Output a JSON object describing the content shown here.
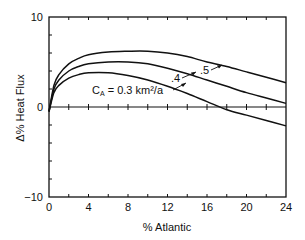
{
  "chart_data": {
    "type": "line",
    "title": "",
    "xlabel": "% Atlantic",
    "ylabel": "Δ% Heat Flux",
    "xlim": [
      0,
      24
    ],
    "ylim": [
      -10,
      10
    ],
    "x_ticks": [
      0,
      4,
      8,
      12,
      16,
      20,
      24
    ],
    "x_tick_labels": [
      "0",
      "4",
      "8",
      "12",
      "16",
      "20",
      "24"
    ],
    "y_ticks": [
      -10,
      0,
      10
    ],
    "y_tick_labels": [
      "-10",
      "0",
      "10"
    ],
    "grid": false,
    "zero_line": true,
    "x": [
      0,
      0.5,
      1,
      2,
      3,
      4,
      6,
      8,
      10,
      12,
      14,
      16,
      18,
      20,
      22,
      24
    ],
    "series": [
      {
        "name": "C_A = 0.3 km²/a",
        "label": "Cₐ = 0.3 km²/a",
        "values": [
          -0.5,
          1.6,
          2.4,
          3.2,
          3.6,
          3.8,
          3.8,
          3.5,
          3.0,
          2.3,
          1.5,
          0.6,
          -0.3,
          -0.9,
          -1.5,
          -2.1
        ]
      },
      {
        "name": ".4",
        "label": ".4",
        "values": [
          -0.5,
          2.0,
          3.0,
          4.0,
          4.5,
          4.8,
          5.0,
          5.0,
          4.8,
          4.3,
          3.7,
          3.0,
          2.3,
          1.6,
          1.0,
          0.4
        ]
      },
      {
        "name": ".5",
        "label": ".5",
        "values": [
          -0.5,
          2.4,
          3.6,
          4.8,
          5.4,
          5.8,
          6.1,
          6.2,
          6.2,
          6.0,
          5.6,
          5.0,
          4.5,
          3.9,
          3.3,
          2.7
        ]
      }
    ],
    "annotations": [
      {
        "text": "Cₐ = 0.3 km²/a",
        "target_series": 0
      },
      {
        "text": ".4",
        "target_series": 1
      },
      {
        "text": ".5",
        "target_series": 2
      }
    ]
  },
  "labels": {
    "xlabel": "% Atlantic",
    "ylabel": "Δ% Heat Flux",
    "annot_03_prefix": "C",
    "annot_03_sub": "A",
    "annot_03_rest": " = 0.3 km²/a",
    "annot_04": ".4",
    "annot_05": ".5"
  }
}
